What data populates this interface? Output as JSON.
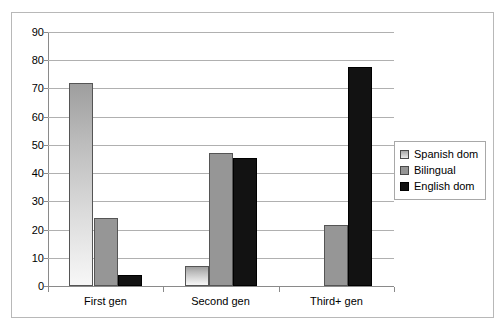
{
  "chart_data": {
    "type": "bar",
    "title": "",
    "subtitle": "",
    "xlabel": "",
    "ylabel": "",
    "categories": [
      "First gen",
      "Second gen",
      "Third+ gen"
    ],
    "series": [
      {
        "name": "Spanish dom",
        "color": "#d0d0d0",
        "values": [
          72,
          7,
          0
        ]
      },
      {
        "name": "Bilingual",
        "color": "#969696",
        "values": [
          24,
          47,
          21.5
        ]
      },
      {
        "name": "English dom",
        "color": "#121212",
        "values": [
          4,
          45.5,
          77.5
        ]
      }
    ],
    "ylim": [
      0,
      90
    ],
    "ytick_step": 10,
    "yticks": [
      90,
      80,
      70,
      60,
      50,
      40,
      30,
      20,
      10,
      0
    ],
    "ytick_labels": [
      "90",
      "80",
      "70",
      "60",
      "50",
      "40",
      "30",
      "20",
      "10",
      "0"
    ],
    "grid": true,
    "grid_axis": "y",
    "legend_position": "right",
    "legend_entries": [
      "Spanish dom",
      "Bilingual",
      "English dom"
    ],
    "plot_background": "#ffffff",
    "gridline_color": "#b0b0b0",
    "axis_color": "#8a8a8a",
    "frame_color": "#b8b8b8"
  }
}
